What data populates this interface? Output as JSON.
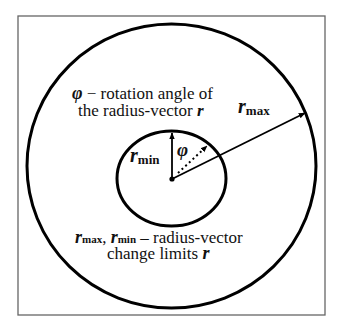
{
  "diagram": {
    "frame": {
      "x": 18,
      "y": 16,
      "width": 307,
      "height": 299,
      "stroke": "#555555"
    },
    "outer_circle": {
      "cx": 171.5,
      "cy": 166,
      "rx": 144.5,
      "ry": 142,
      "stroke": "#000000"
    },
    "inner_circle": {
      "cx": 171.5,
      "cy": 178.5,
      "rx": 54.5,
      "ry": 47.5,
      "stroke": "#000000"
    },
    "center_point": {
      "x": 172,
      "y": 179
    },
    "arrows": {
      "r_min": {
        "x1": 172,
        "y1": 179,
        "x2": 172,
        "y2": 132
      },
      "r_max": {
        "x1": 172,
        "y1": 179,
        "x2": 305,
        "y2": 113
      },
      "phi_dotted": {
        "x1": 174,
        "y1": 177,
        "x2": 208,
        "y2": 145
      }
    },
    "labels": {
      "phi_symbol": "φ",
      "top_line1_rest": " − rotation angle of",
      "top_line2_pre": "the radius-vector ",
      "r": "r",
      "r_max_main": "r",
      "r_max_sub": "max",
      "r_min_main": "r",
      "r_min_sub": "min",
      "phi_angle": "φ",
      "bottom_line1_r1": "r",
      "bottom_line1_sub1": "max",
      "bottom_line1_sep": ", ",
      "bottom_line1_r2": "r",
      "bottom_line1_sub2": "min",
      "bottom_line1_rest": " – radius-vector",
      "bottom_line2_pre": "change limits ",
      "bottom_line2_r": "r"
    }
  }
}
